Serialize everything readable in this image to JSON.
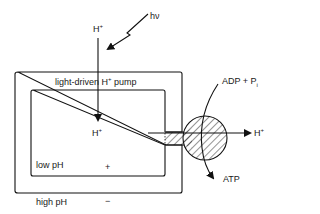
{
  "diagram": {
    "labels": {
      "h_plus_top": "H",
      "h_plus_top_sup": "+",
      "photon": "hν",
      "pump_label_pre": "light-driven H",
      "pump_label_sup": "+",
      "pump_label_post": " pump",
      "h_plus_inside": "H",
      "h_plus_inside_sup": "+",
      "low_ph": "low pH",
      "plus_sign": "+",
      "high_ph": "high pH",
      "minus_sign": "−",
      "adp_pi": "ADP + P",
      "adp_pi_sub": "i",
      "h_plus_out": "H",
      "h_plus_out_sup": "+",
      "atp": "ATP"
    },
    "colors": {
      "stroke": "#111111",
      "background": "#ffffff"
    }
  }
}
